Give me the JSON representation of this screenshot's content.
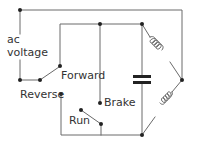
{
  "diagram": {
    "type": "circuit-schematic",
    "labels": {
      "ac_voltage_line1": "ac",
      "ac_voltage_line2": "voltage",
      "forward": "Forward",
      "reverse": "Reverse",
      "brake": "Brake",
      "run": "Run"
    },
    "components": [
      {
        "id": "ac-source",
        "kind": "terminal",
        "label": "ac voltage"
      },
      {
        "id": "direction-switch",
        "kind": "spdt-switch",
        "positions": [
          "Forward",
          "Reverse"
        ]
      },
      {
        "id": "brake-run-switch",
        "kind": "spdt-switch",
        "positions": [
          "Brake",
          "Run"
        ]
      },
      {
        "id": "capacitor",
        "kind": "capacitor"
      },
      {
        "id": "winding-1",
        "kind": "inductor-coil"
      },
      {
        "id": "winding-2",
        "kind": "inductor-coil"
      }
    ],
    "colors": {
      "line": "#6a6a6a",
      "dot": "#222222",
      "capacitor": "#222222",
      "background": "#ffffff"
    }
  }
}
